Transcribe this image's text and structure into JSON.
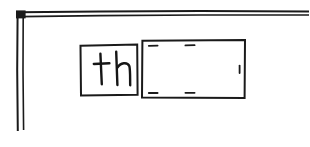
{
  "canvas": {
    "width": 309,
    "height": 147,
    "background_color": "#ffffff",
    "ink_color": "#1a1a1a",
    "description": "hand-drawn black ink sketch on white paper"
  },
  "frame": {
    "name": "double-line corner frame",
    "style": "two roughly parallel hand-drawn lines",
    "horizontal_rule": {
      "label": "top double line",
      "from_x": 18,
      "to_x": 309,
      "y": 14
    },
    "vertical_rule": {
      "label": "left double line",
      "from_y": 16,
      "to_y": 131,
      "x": 18
    },
    "corner_label": "top-left corner joint"
  },
  "shapes": {
    "text_box": {
      "name": "left rectangle with handwriting",
      "label": "th",
      "x": 80,
      "y": 45,
      "width": 57,
      "height": 50,
      "fill": "#ffffff",
      "stroke": "#1a1a1a"
    },
    "blank_box": {
      "name": "right empty rectangle",
      "label": "",
      "x": 142,
      "y": 40,
      "width": 103,
      "height": 58,
      "fill": "#ffffff",
      "stroke": "#1a1a1a",
      "tick_marks": [
        {
          "edge": "top",
          "x": 152,
          "y": 46
        },
        {
          "edge": "top",
          "x": 190,
          "y": 46
        },
        {
          "edge": "bottom",
          "x": 152,
          "y": 93
        },
        {
          "edge": "bottom",
          "x": 190,
          "y": 93
        },
        {
          "edge": "right",
          "x": 239,
          "y": 69
        }
      ]
    }
  },
  "handwriting": {
    "content": "th",
    "letters": [
      "t",
      "h"
    ],
    "style": "lowercase handwritten print"
  }
}
